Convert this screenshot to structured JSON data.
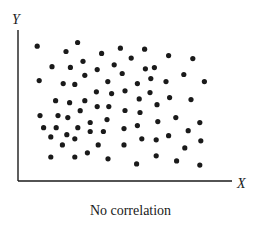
{
  "chart_data": {
    "type": "scatter",
    "title": "No correlation",
    "xlabel": "X",
    "ylabel": "Y",
    "grid": false,
    "legend": null,
    "axis_ticks": "none",
    "xlim": [
      0,
      100
    ],
    "ylim": [
      0,
      100
    ],
    "note": "Values are normalized positions (0-100) within the plot area; axes have no numeric ticks.",
    "points": [
      [
        6.6,
        90.7
      ],
      [
        21.0,
        87.0
      ],
      [
        26.8,
        93.3
      ],
      [
        29.5,
        80.1
      ],
      [
        14.0,
        76.3
      ],
      [
        23.2,
        75.8
      ],
      [
        30.4,
        70.2
      ],
      [
        7.6,
        66.5
      ],
      [
        19.6,
        64.4
      ],
      [
        25.4,
        63.8
      ],
      [
        38.8,
        85.6
      ],
      [
        48.2,
        89.3
      ],
      [
        60.3,
        88.6
      ],
      [
        53.6,
        82.3
      ],
      [
        45.1,
        77.6
      ],
      [
        36.6,
        74.2
      ],
      [
        60.7,
        74.8
      ],
      [
        65.2,
        75.6
      ],
      [
        49.1,
        71.5
      ],
      [
        41.9,
        65.8
      ],
      [
        56.7,
        64.4
      ],
      [
        63.4,
        67.9
      ],
      [
        72.3,
        84.1
      ],
      [
        84.4,
        82.0
      ],
      [
        79.9,
        70.8
      ],
      [
        71.0,
        65.8
      ],
      [
        90.2,
        65.8
      ],
      [
        15.8,
        52.3
      ],
      [
        22.8,
        50.9
      ],
      [
        30.4,
        52.3
      ],
      [
        8.0,
        41.8
      ],
      [
        17.0,
        41.8
      ],
      [
        21.9,
        40.4
      ],
      [
        28.1,
        45.3
      ],
      [
        9.8,
        33.3
      ],
      [
        16.1,
        33.3
      ],
      [
        26.9,
        33.3
      ],
      [
        33.1,
        37.0
      ],
      [
        21.4,
        28.4
      ],
      [
        13.4,
        26.8
      ],
      [
        36.2,
        58.6
      ],
      [
        43.8,
        57.3
      ],
      [
        50.5,
        59.3
      ],
      [
        63.0,
        58.0
      ],
      [
        57.6,
        53.6
      ],
      [
        66.5,
        49.5
      ],
      [
        36.6,
        48.2
      ],
      [
        42.4,
        48.2
      ],
      [
        50.5,
        45.4
      ],
      [
        58.0,
        44.0
      ],
      [
        41.5,
        39.0
      ],
      [
        66.9,
        37.6
      ],
      [
        56.7,
        34.8
      ],
      [
        50.0,
        32.7
      ],
      [
        33.1,
        30.6
      ],
      [
        39.7,
        30.6
      ],
      [
        72.8,
        54.5
      ],
      [
        83.5,
        53.1
      ],
      [
        75.9,
        40.4
      ],
      [
        87.9,
        36.9
      ],
      [
        82.1,
        31.2
      ],
      [
        72.3,
        27.7
      ],
      [
        25.4,
        25.5
      ],
      [
        19.2,
        21.2
      ],
      [
        37.1,
        21.2
      ],
      [
        50.0,
        21.2
      ],
      [
        13.4,
        12.7
      ],
      [
        25.4,
        12.7
      ],
      [
        31.7,
        15.6
      ],
      [
        42.0,
        11.4
      ],
      [
        58.9,
        25.5
      ],
      [
        66.1,
        24.8
      ],
      [
        80.4,
        19.1
      ],
      [
        88.4,
        24.1
      ],
      [
        66.1,
        13.5
      ],
      [
        56.3,
        7.8
      ],
      [
        76.3,
        9.9
      ],
      [
        87.9,
        7.0
      ]
    ]
  },
  "caption": "No correlation",
  "axes": {
    "x_label": "X",
    "y_label": "Y"
  },
  "colors": {
    "ink": "#1a1a1a",
    "background": "#ffffff"
  }
}
